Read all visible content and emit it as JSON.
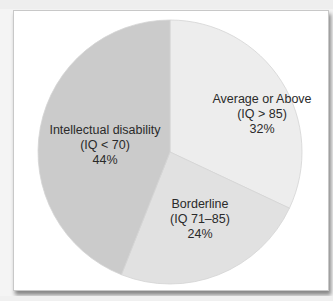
{
  "chart_data": {
    "type": "pie",
    "title": "",
    "start_angle_deg": 0,
    "direction": "clockwise",
    "slices": [
      {
        "label": "Average or Above",
        "range": "(IQ > 85)",
        "value": 32,
        "percent_label": "32%",
        "color": "#ededed"
      },
      {
        "label": "Borderline",
        "range": "(IQ 71–85)",
        "value": 24,
        "percent_label": "24%",
        "color": "#e1e1e1"
      },
      {
        "label": "Intellectual disability",
        "range": "(IQ < 70)",
        "value": 44,
        "percent_label": "44%",
        "color": "#cbcbcb"
      }
    ],
    "categories": [
      "Average or Above (IQ > 85)",
      "Borderline (IQ 71–85)",
      "Intellectual disability (IQ < 70)"
    ],
    "values": [
      32,
      24,
      44
    ],
    "legend": "none (labels inside slices)"
  },
  "labels": {
    "average": {
      "name": "Average or Above",
      "range": "(IQ > 85)",
      "pct": "32%"
    },
    "borderline": {
      "name": "Borderline",
      "range": "(IQ 71–85)",
      "pct": "24%"
    },
    "intellectual": {
      "name": "Intellectual disability",
      "range": "(IQ < 70)",
      "pct": "44%"
    }
  }
}
